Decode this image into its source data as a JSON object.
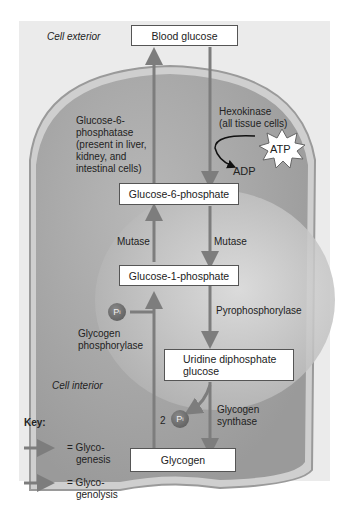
{
  "diagram": {
    "regions": {
      "exterior": "Cell exterior",
      "interior": "Cell interior"
    },
    "nodes": {
      "blood_glucose": "Blood glucose",
      "g6p": "Glucose-6-phosphate",
      "g1p": "Glucose-1-phosphate",
      "udpg_line1": "Uridine diphosphate",
      "udpg_line2": "glucose",
      "glycogen": "Glycogen"
    },
    "enzymes": {
      "g6pase": [
        "Glucose-6-",
        "phosphatase",
        "(present in liver,",
        "kidney, and",
        "intestinal cells)"
      ],
      "hexokinase": [
        "Hexokinase",
        "(all tissue cells)"
      ],
      "mutase_left": "Mutase",
      "mutase_right": "Mutase",
      "pyrophosphorylase": "Pyrophosphorylase",
      "glycogen_phosphorylase": [
        "Glycogen",
        "phosphorylase"
      ],
      "glycogen_synthase": [
        "Glycogen",
        "synthase"
      ]
    },
    "cofactors": {
      "atp": "ATP",
      "adp": "ADP",
      "pi": "P",
      "pi_sub": "i",
      "two_pi_count": "2"
    },
    "key": {
      "title": "Key:",
      "items": [
        {
          "label_1": "= Glyco-",
          "label_2": "genesis"
        },
        {
          "label_1": "= Glyco-",
          "label_2": "genolysis"
        }
      ]
    },
    "colors": {
      "arrow": "#7d7d7d",
      "cell": "#a9a9a9",
      "membrane": "#9a9a9a",
      "nucleus": "#c9c9c9"
    }
  }
}
